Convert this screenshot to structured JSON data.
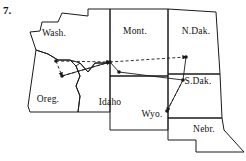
{
  "figure": {
    "number": "7.",
    "caption": "",
    "background_color": "#ffffff",
    "ink_color": "#1a1a1a"
  },
  "map": {
    "title": "",
    "region": "Northwestern United States",
    "state_labels": [
      {
        "id": "wash",
        "text": "Wash.",
        "x": 54,
        "y": 36
      },
      {
        "id": "mont",
        "text": "Mont.",
        "x": 135,
        "y": 34
      },
      {
        "id": "ndak",
        "text": "N.Dak.",
        "x": 196,
        "y": 34
      },
      {
        "id": "oreg",
        "text": "Oreg.",
        "x": 48,
        "y": 102
      },
      {
        "id": "idaho",
        "text": "Idaho",
        "x": 110,
        "y": 105
      },
      {
        "id": "sdak",
        "text": "S.Dak.",
        "x": 198,
        "y": 84
      },
      {
        "id": "wyo",
        "text": "Wyo.",
        "x": 152,
        "y": 117
      },
      {
        "id": "nebr",
        "text": "Nebr.",
        "x": 204,
        "y": 132
      }
    ],
    "borders": [
      {
        "id": "washington-outline",
        "d": "M36 50 L30 32 L40 31 L42 22 L58 22 L62 13 L88 16 L88 9 L110 9 L110 63 L95 63 L88 72 L80 63 L70 60 L58 60 L48 54 Z"
      },
      {
        "id": "oregon-outline",
        "d": "M36 50 L48 54 L58 60 L70 60 L76 66 L80 76 L76 86 L80 96 L78 112 L30 112 L28 106 Z"
      },
      {
        "id": "idaho-outline",
        "d": "M80 63 L88 72 L95 63 L110 63 L110 112 L78 112 L80 96 L76 86 L80 76 L76 66 Z"
      },
      {
        "id": "montana-outline",
        "d": "M110 9 L168 9 L168 76 L110 76 Z"
      },
      {
        "id": "north-dakota-outline",
        "d": "M168 9 L216 12 L220 74 L168 74 Z"
      },
      {
        "id": "south-dakota-outline",
        "d": "M168 74 L220 74 L222 118 L168 118 Z"
      },
      {
        "id": "wyoming-outline",
        "d": "M110 76 L168 76 L168 130 L110 130 Z"
      },
      {
        "id": "nebraska-outline",
        "d": "M168 118 L222 118 L224 130 L244 152 L196 152 L196 140 L168 140 Z"
      }
    ],
    "graph": {
      "nodes": [
        {
          "id": "n1",
          "x": 56,
          "y": 61,
          "label": ""
        },
        {
          "id": "n2",
          "x": 62,
          "y": 76,
          "label": ""
        },
        {
          "id": "n3",
          "x": 110,
          "y": 62,
          "label": ""
        },
        {
          "id": "n4",
          "x": 119,
          "y": 72,
          "label": ""
        },
        {
          "id": "n5",
          "x": 186,
          "y": 57,
          "label": ""
        },
        {
          "id": "n6",
          "x": 183,
          "y": 80,
          "label": ""
        },
        {
          "id": "n7",
          "x": 167,
          "y": 111,
          "label": ""
        }
      ],
      "solid_edges": [
        {
          "id": "e-solid-1",
          "from": "n3",
          "to": "n4"
        },
        {
          "id": "e-solid-2",
          "from": "n4",
          "to": "n6"
        },
        {
          "id": "e-solid-3",
          "from": "n3",
          "to": "n2"
        },
        {
          "id": "e-solid-4",
          "from": "n6",
          "to": "n7"
        },
        {
          "id": "e-solid-5",
          "from": "n5",
          "to": "n6"
        }
      ],
      "dashed_edges": [
        {
          "id": "e-dash-1",
          "from": "n1",
          "to": "n3",
          "arrow": true
        },
        {
          "id": "e-dash-2",
          "from": "n2",
          "to": "n3",
          "arrow": true
        },
        {
          "id": "e-dash-3",
          "from": "n3",
          "to": "n5",
          "arrow": true
        },
        {
          "id": "e-dash-4",
          "from": "n1",
          "to": "n2",
          "arrow": true
        },
        {
          "id": "e-dash-5",
          "from": "n6",
          "to": "n7",
          "arrow": true
        }
      ]
    }
  }
}
